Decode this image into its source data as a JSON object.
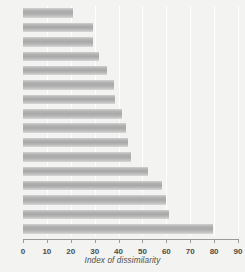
{
  "chart_data": {
    "type": "bar",
    "orientation": "horizontal",
    "title": "",
    "xlabel": "Index of dissimilarity",
    "ylabel": "",
    "xlim": [
      0,
      90
    ],
    "xticks": [
      0,
      10,
      20,
      30,
      40,
      50,
      60,
      70,
      80,
      90
    ],
    "grid": "vertical-white-gridlines",
    "legend": "none",
    "categories": [
      "c Irish",
      "White",
      "Asian",
      "mixed",
      "bbean",
      "hinese",
      "frican",
      "ndian",
      "ritish",
      "group",
      "Asian",
      "frican",
      "bbean",
      "Black",
      "kistani",
      "adeshi"
    ],
    "values": [
      21,
      29.5,
      29.5,
      32,
      35,
      38,
      38.5,
      41.5,
      43,
      44,
      45,
      52.5,
      58,
      60,
      61,
      79.5
    ]
  },
  "axis": {
    "tick_labels": [
      "0",
      "10",
      "20",
      "30",
      "40",
      "50",
      "60",
      "70",
      "80",
      "90"
    ],
    "title": "Index of dissimilarity"
  },
  "colors": {
    "background": "#f3f3f1",
    "bar_mid": "#a8a8a8",
    "bar_edge": "#d8d8d8",
    "gridline": "#ffffff",
    "axis": "#9a9a98",
    "text": "#4d4d4b"
  }
}
